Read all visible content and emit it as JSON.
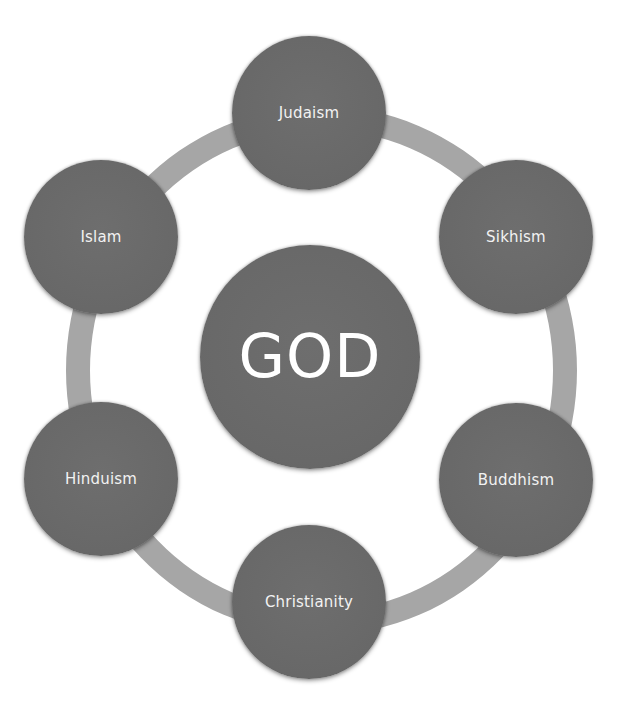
{
  "diagram": {
    "type": "radial-cycle",
    "center": {
      "label": "GOD",
      "x": 310,
      "y": 357
    },
    "nodes": [
      {
        "label": "Judaism",
        "x": 309,
        "y": 113
      },
      {
        "label": "Sikhism",
        "x": 516,
        "y": 237
      },
      {
        "label": "Buddhism",
        "x": 516,
        "y": 480
      },
      {
        "label": "Christianity",
        "x": 309,
        "y": 602
      },
      {
        "label": "Hinduism",
        "x": 101,
        "y": 479
      },
      {
        "label": "Islam",
        "x": 101,
        "y": 237
      }
    ],
    "colors": {
      "node_fill": "#6b6b6b",
      "ring": "#a6a6a6",
      "text": "#f2f2f2",
      "background": "#ffffff"
    }
  }
}
